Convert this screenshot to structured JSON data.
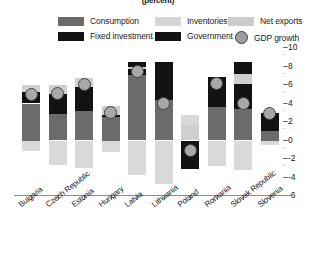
{
  "chart_data": {
    "type": "bar",
    "title": "(percent)",
    "xlabel": "",
    "ylabel": "",
    "ylim": [
      -6,
      10
    ],
    "yticks": [
      -6,
      -4,
      -2,
      0,
      2,
      4,
      6,
      8,
      10
    ],
    "ytick_labels": [
      "-6",
      "-4",
      "-2",
      "0",
      "2",
      "4",
      "6",
      "8",
      "10"
    ],
    "grid": false,
    "legend_position": "top",
    "stacked": true,
    "categories": [
      "Bulgaria",
      "Czech Republic",
      "Estonia",
      "Hungary",
      "Latvia",
      "Lithuania",
      "Poland",
      "Romania",
      "Slovak Republic",
      "Slovenia"
    ],
    "series": [
      {
        "name": "Consumption",
        "color": "#6b6b6b",
        "values": [
          4.0,
          2.9,
          3.2,
          2.5,
          7.1,
          4.4,
          0.0,
          3.6,
          3.4,
          1.0
        ]
      },
      {
        "name": "Fixed investment",
        "color": "#121212",
        "values": [
          1.2,
          2.1,
          2.6,
          0.3,
          0.6,
          2.2,
          -3.1,
          2.5,
          2.7,
          1.1
        ]
      },
      {
        "name": "Inventories",
        "color": "#cfcfcf",
        "values": [
          0.8,
          1.0,
          1.0,
          0.9,
          0.3,
          0.0,
          1.7,
          0.0,
          1.1,
          0.0
        ]
      },
      {
        "name": "Government",
        "color": "#121212",
        "values": [
          0.0,
          0.0,
          0.0,
          0.0,
          0.5,
          1.9,
          0.0,
          0.8,
          1.3,
          0.9
        ]
      },
      {
        "name": "Net exports",
        "color": "#d9d9d9",
        "values": [
          -1.1,
          -2.6,
          -3.0,
          -1.2,
          -3.7,
          -4.7,
          1.1,
          -2.8,
          -3.2,
          -0.5
        ]
      }
    ],
    "markers": {
      "name": "GDP growth",
      "color": "#a8a8a8",
      "values": [
        5.0,
        5.1,
        6.1,
        3.0,
        7.5,
        4.0,
        -1.1,
        6.2,
        4.0,
        2.9
      ]
    }
  },
  "legend": {
    "items": [
      {
        "label": "Consumption",
        "swatch": "#6b6b6b",
        "shape": "rect"
      },
      {
        "label": "Fixed investment",
        "swatch": "#121212",
        "shape": "rect"
      },
      {
        "label": "Inventories",
        "swatch": "#d6d6d6",
        "shape": "rect"
      },
      {
        "label": "Government",
        "swatch": "#121212",
        "shape": "rect"
      },
      {
        "label": "Net exports",
        "swatch": "#cccccc",
        "shape": "rect"
      },
      {
        "label": "GDP growth",
        "swatch": "#9e9e9e",
        "shape": "circle"
      }
    ]
  }
}
